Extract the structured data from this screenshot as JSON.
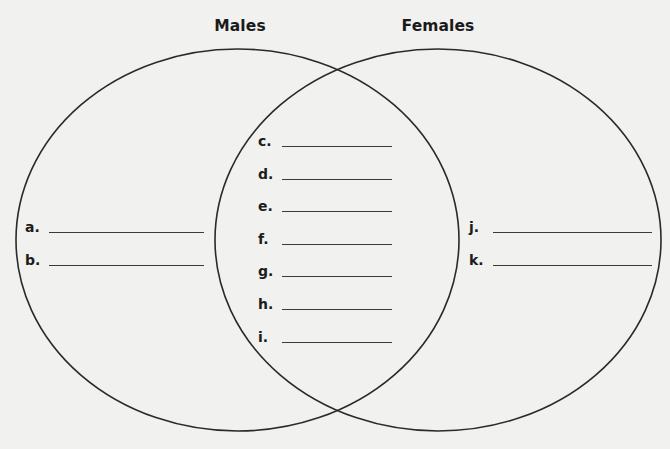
{
  "diagram": {
    "type": "venn",
    "sets": [
      {
        "name": "Males"
      },
      {
        "name": "Females"
      }
    ],
    "colors": {
      "background": "#f1f1f0",
      "outline": "#2a2a2a",
      "text": "#1a1a1a"
    }
  },
  "left_only": {
    "items": [
      {
        "label": "a.",
        "value": ""
      },
      {
        "label": "b.",
        "value": ""
      }
    ]
  },
  "overlap": {
    "items": [
      {
        "label": "c.",
        "value": ""
      },
      {
        "label": "d.",
        "value": ""
      },
      {
        "label": "e.",
        "value": ""
      },
      {
        "label": "f.",
        "value": ""
      },
      {
        "label": "g.",
        "value": ""
      },
      {
        "label": "h.",
        "value": ""
      },
      {
        "label": "i.",
        "value": ""
      }
    ]
  },
  "right_only": {
    "items": [
      {
        "label": "j.",
        "value": ""
      },
      {
        "label": "k.",
        "value": ""
      }
    ]
  }
}
